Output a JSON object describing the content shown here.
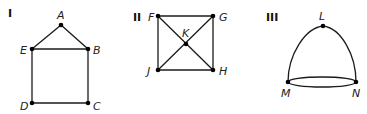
{
  "figures": [
    {
      "label": "I",
      "vertices": [
        {
          "name": "A",
          "x": 61,
          "y": 25
        },
        {
          "name": "E",
          "x": 32,
          "y": 49
        },
        {
          "name": "B",
          "x": 88,
          "y": 49
        },
        {
          "name": "D",
          "x": 32,
          "y": 103
        },
        {
          "name": "C",
          "x": 88,
          "y": 103
        }
      ],
      "edges": [
        [
          "A",
          "E"
        ],
        [
          "A",
          "B"
        ],
        [
          "E",
          "B"
        ],
        [
          "E",
          "D"
        ],
        [
          "B",
          "C"
        ],
        [
          "D",
          "C"
        ]
      ]
    },
    {
      "label": "II",
      "vertices": [
        {
          "name": "F",
          "x": 158,
          "y": 16
        },
        {
          "name": "G",
          "x": 213,
          "y": 16
        },
        {
          "name": "K",
          "x": 186,
          "y": 44
        },
        {
          "name": "J",
          "x": 158,
          "y": 70
        },
        {
          "name": "H",
          "x": 213,
          "y": 70
        }
      ],
      "edges": [
        [
          "F",
          "G"
        ],
        [
          "G",
          "H"
        ],
        [
          "H",
          "J"
        ],
        [
          "J",
          "F"
        ],
        [
          "F",
          "K"
        ],
        [
          "K",
          "H"
        ],
        [
          "G",
          "K"
        ],
        [
          "K",
          "J"
        ]
      ]
    },
    {
      "label": "III",
      "vertices": [
        {
          "name": "L",
          "x": 323,
          "y": 26
        },
        {
          "name": "M",
          "x": 288,
          "y": 82
        },
        {
          "name": "N",
          "x": 356,
          "y": 82
        }
      ],
      "edges": [
        [
          "L",
          "M",
          "curved"
        ],
        [
          "L",
          "N",
          "curved"
        ],
        [
          "M",
          "N",
          "upper-arc"
        ],
        [
          "M",
          "N",
          "lower-arc"
        ]
      ]
    }
  ]
}
